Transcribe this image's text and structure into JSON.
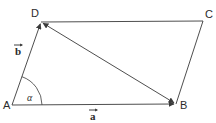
{
  "figure": {
    "type": "parallelogram-vector-diagram",
    "stroke_color": "#3a3a3a",
    "text_color": "#2b2b2b",
    "background_color": "#ffffff",
    "width": 216,
    "height": 123
  },
  "vertices": [
    {
      "name": "A",
      "label": "A",
      "x": 12,
      "y": 105,
      "label_x": 3,
      "label_y": 100
    },
    {
      "name": "B",
      "label": "B",
      "x": 176,
      "y": 104,
      "label_x": 180,
      "label_y": 100
    },
    {
      "name": "C",
      "label": "C",
      "x": 203,
      "y": 21,
      "label_x": 205,
      "label_y": 9
    },
    {
      "name": "D",
      "label": "D",
      "x": 41,
      "y": 22,
      "label_x": 31,
      "label_y": 8
    }
  ],
  "edges": [
    {
      "name": "AB",
      "from": "A",
      "to": "B",
      "arrow": "end"
    },
    {
      "name": "AD",
      "from": "A",
      "to": "D",
      "arrow": "end"
    },
    {
      "name": "DC",
      "from": "D",
      "to": "C",
      "arrow": "none"
    },
    {
      "name": "CB",
      "from": "C",
      "to": "B",
      "arrow": "none"
    }
  ],
  "diagonal": {
    "name": "DB",
    "from": "D",
    "to": "B",
    "arrow": "both"
  },
  "vector_labels": [
    {
      "name": "a",
      "label": "a",
      "x": 90,
      "y": 110
    },
    {
      "name": "b",
      "label": "b",
      "x": 15,
      "y": 45
    }
  ],
  "angle": {
    "name": "alpha",
    "label": "α",
    "at_vertex": "A",
    "label_x": 27,
    "label_y": 94,
    "radius": 30
  }
}
